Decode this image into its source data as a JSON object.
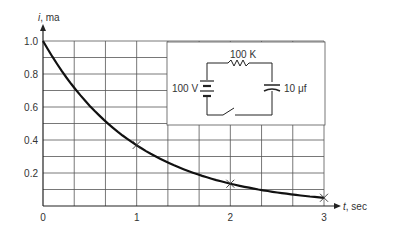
{
  "chart_data": {
    "type": "line",
    "title": "",
    "xlabel": "t, sec",
    "ylabel": "i, ma",
    "xlim": [
      0,
      3
    ],
    "ylim": [
      0,
      1.0
    ],
    "grid": true,
    "x_ticks": [
      "0",
      "1",
      "2",
      "3"
    ],
    "y_ticks": [
      "0.2",
      "0.4",
      "0.6",
      "0.8",
      "1.0"
    ],
    "series": [
      {
        "name": "current decay i = e^(-t)",
        "x": [
          0,
          0.25,
          0.5,
          0.75,
          1.0,
          1.25,
          1.5,
          1.75,
          2.0,
          2.25,
          2.5,
          2.75,
          3.0
        ],
        "values": [
          1.0,
          0.78,
          0.61,
          0.47,
          0.37,
          0.29,
          0.22,
          0.17,
          0.135,
          0.105,
          0.082,
          0.064,
          0.05
        ]
      }
    ],
    "markers": [
      {
        "x": 1,
        "y": 0.37,
        "symbol": "x"
      },
      {
        "x": 2,
        "y": 0.135,
        "symbol": "x"
      },
      {
        "x": 3,
        "y": 0.05,
        "symbol": "x"
      }
    ],
    "annotations": {
      "inset_circuit": {
        "resistor_label": "100 K",
        "battery_label": "100 V",
        "capacitor_label": "10 μf"
      }
    }
  },
  "axes": {
    "y_label_var": "i",
    "y_label_unit": ", ma",
    "x_label_var": "t",
    "x_label_unit": ", sec"
  }
}
